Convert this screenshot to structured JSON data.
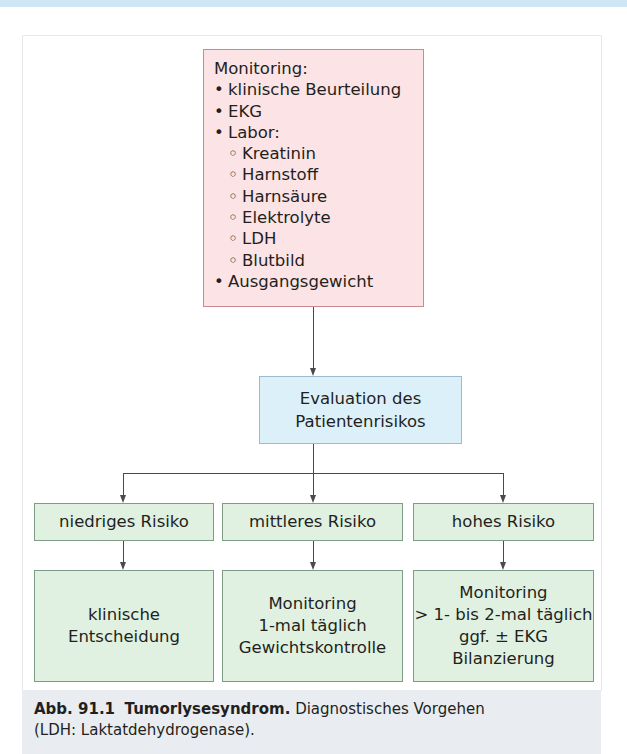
{
  "figure": {
    "monitoring_box": {
      "title": "Monitoring:",
      "items": [
        {
          "bullet": "•",
          "text": "klinische Beurteilung"
        },
        {
          "bullet": "•",
          "text": "EKG"
        },
        {
          "bullet": "•",
          "text": "Labor:"
        },
        {
          "bullet": "◦",
          "text": "Kreatinin"
        },
        {
          "bullet": "◦",
          "text": "Harnstoff"
        },
        {
          "bullet": "◦",
          "text": "Harnsäure"
        },
        {
          "bullet": "◦",
          "text": "Elektrolyte"
        },
        {
          "bullet": "◦",
          "text": "LDH"
        },
        {
          "bullet": "◦",
          "text": "Blutbild"
        },
        {
          "bullet": "•",
          "text": "Ausgangsgewicht"
        }
      ]
    },
    "evaluation_box": {
      "line1": "Evaluation des",
      "line2": "Patientenrisikos"
    },
    "risk_levels": [
      {
        "label": "niedriges Risiko",
        "result": [
          "klinische",
          "Entscheidung"
        ]
      },
      {
        "label": "mittleres Risiko",
        "result": [
          "Monitoring",
          "1-mal täglich",
          "Gewichtskontrolle"
        ]
      },
      {
        "label": "hohes Risiko",
        "result": [
          "Monitoring",
          "> 1- bis 2-mal täglich",
          "ggf. ± EKG",
          "Bilanzierung"
        ]
      }
    ],
    "colors": {
      "monitoring_fill": "#fbe3e6",
      "evaluation_fill": "#dcf0f9",
      "risk_fill": "#e0f1e1",
      "caption_fill": "#e9edf1"
    }
  },
  "caption": {
    "label": "Abb. 91.1",
    "title": "Tumorlysesyndrom.",
    "text": "Diagnostisches Vorgehen",
    "text2": "(LDH: Laktatdehydrogenase)."
  }
}
